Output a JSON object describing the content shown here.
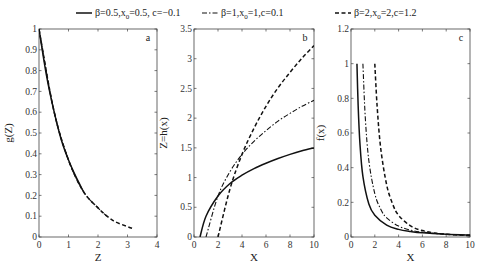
{
  "chart_data": {
    "type": "line",
    "legend": {
      "placement": "top-center",
      "entries": [
        {
          "label": "β=0.5,x0=0.5, c=−0.1",
          "label_parts": [
            "β=0.5,x",
            "0",
            "=0.5, c=−0.1"
          ],
          "style": "solid",
          "beta": 0.5,
          "x0": 0.5,
          "c": -0.1
        },
        {
          "label": "β=1,x0=1,c=0.1",
          "label_parts": [
            "β=1,x",
            "0",
            "=1,c=0.1"
          ],
          "style": "dashdot",
          "beta": 1,
          "x0": 1,
          "c": 0.1
        },
        {
          "label": "β=2,x0=2,c=1.2",
          "label_parts": [
            "β=2,x",
            "0",
            "=2,c=1.2"
          ],
          "style": "dashed",
          "beta": 2,
          "x0": 2,
          "c": 1.2
        }
      ]
    },
    "panels": [
      {
        "id": "a",
        "tag": "a",
        "xlabel": "Z",
        "ylabel": "g(Z)",
        "xlim": [
          0,
          4
        ],
        "ylim": [
          0,
          1
        ],
        "xticks": [
          0,
          1,
          2,
          3,
          4
        ],
        "xtick_labels": [
          "0",
          "1",
          "2",
          "3",
          "4"
        ],
        "yticks": [
          0,
          0.1,
          0.2,
          0.3,
          0.4,
          0.5,
          0.6,
          0.7,
          0.8,
          0.9,
          1
        ],
        "ytick_labels": [
          "0",
          "0.1",
          "0.2",
          "0.3",
          "0.4",
          "0.5",
          "0.6",
          "0.7",
          "0.8",
          "0.9",
          "1"
        ],
        "series": [
          {
            "name": "β=0.5,x0=0.5, c=−0.1",
            "style": "solid",
            "x": [
              0,
              0.25,
              0.5,
              0.75,
              1.0,
              1.25,
              1.5
            ],
            "y": [
              1.0,
              0.78,
              0.61,
              0.47,
              0.37,
              0.29,
              0.22
            ]
          },
          {
            "name": "β=1,x0=1,c=0.1",
            "style": "dashdot",
            "x": [
              0,
              0.5,
              1.0,
              1.5,
              2.0,
              2.3
            ],
            "y": [
              1.0,
              0.61,
              0.37,
              0.22,
              0.14,
              0.1
            ]
          },
          {
            "name": "β=2,x0=2,c=1.2",
            "style": "dashed",
            "x": [
              0,
              0.5,
              1.0,
              1.5,
              2.0,
              2.5,
              3.0,
              3.2
            ],
            "y": [
              1.0,
              0.61,
              0.37,
              0.22,
              0.14,
              0.08,
              0.05,
              0.04
            ]
          }
        ]
      },
      {
        "id": "b",
        "tag": "b",
        "xlabel": "X",
        "ylabel": "Z=h(x)",
        "xlim": [
          0,
          10
        ],
        "ylim": [
          0,
          3.5
        ],
        "xticks": [
          0,
          2,
          4,
          6,
          8,
          10
        ],
        "xtick_labels": [
          "0",
          "2",
          "4",
          "6",
          "8",
          "10"
        ],
        "yticks": [
          0,
          0.5,
          1,
          1.5,
          2,
          2.5,
          3,
          3.5
        ],
        "ytick_labels": [
          "0",
          "0.5",
          "1",
          "1.5",
          "2",
          "2.5",
          "3",
          "3.5"
        ],
        "series": [
          {
            "name": "β=0.5,x0=0.5, c=−0.1",
            "style": "solid",
            "x": [
              0.5,
              1,
              2,
              3,
              4,
              5,
              6,
              7,
              8,
              9,
              10
            ],
            "y": [
              0,
              0.35,
              0.69,
              0.9,
              1.04,
              1.15,
              1.24,
              1.32,
              1.39,
              1.45,
              1.5
            ]
          },
          {
            "name": "β=1,x0=1,c=0.1",
            "style": "dashdot",
            "x": [
              1,
              2,
              3,
              4,
              5,
              6,
              7,
              8,
              9,
              10
            ],
            "y": [
              0,
              0.69,
              1.1,
              1.39,
              1.61,
              1.79,
              1.95,
              2.08,
              2.2,
              2.3
            ]
          },
          {
            "name": "β=2,x0=2,c=1.2",
            "style": "dashed",
            "x": [
              2,
              3,
              4,
              5,
              6,
              7,
              8,
              9,
              10
            ],
            "y": [
              0,
              0.81,
              1.39,
              1.83,
              2.2,
              2.51,
              2.77,
              3.01,
              3.22
            ]
          }
        ]
      },
      {
        "id": "c",
        "tag": "c",
        "xlabel": "X",
        "ylabel": "f(x)",
        "xlim": [
          0,
          10
        ],
        "ylim": [
          0,
          1.2
        ],
        "xticks": [
          0,
          2,
          4,
          6,
          8,
          10
        ],
        "xtick_labels": [
          "0",
          "2",
          "4",
          "6",
          "8",
          "10"
        ],
        "yticks": [
          0,
          0.2,
          0.4,
          0.6,
          0.8,
          1,
          1.2
        ],
        "ytick_labels": [
          "0",
          "0.2",
          "0.4",
          "0.6",
          "0.8",
          "1",
          "1.2"
        ],
        "series": [
          {
            "name": "β=0.5,x0=0.5, c=−0.1",
            "style": "solid",
            "x": [
              0.5,
              0.6,
              0.75,
              1,
              1.5,
              2,
              3,
              4,
              5,
              6,
              8,
              10
            ],
            "y": [
              1.0,
              0.76,
              0.54,
              0.35,
              0.19,
              0.125,
              0.068,
              0.044,
              0.032,
              0.024,
              0.016,
              0.011
            ]
          },
          {
            "name": "β=1,x0=1,c=0.1",
            "style": "dashdot",
            "x": [
              1,
              1.2,
              1.5,
              2,
              2.5,
              3,
              4,
              5,
              6,
              8,
              10
            ],
            "y": [
              1.0,
              0.69,
              0.44,
              0.25,
              0.16,
              0.11,
              0.063,
              0.04,
              0.028,
              0.016,
              0.01
            ]
          },
          {
            "name": "β=2,x0=2,c=1.2",
            "style": "dashed",
            "x": [
              2,
              2.2,
              2.5,
              3,
              3.5,
              4,
              5,
              6,
              7,
              8,
              10
            ],
            "y": [
              1.0,
              0.75,
              0.51,
              0.3,
              0.19,
              0.125,
              0.064,
              0.037,
              0.023,
              0.016,
              0.008
            ]
          }
        ]
      }
    ]
  }
}
